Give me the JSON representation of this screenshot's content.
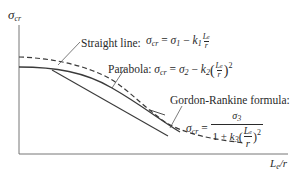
{
  "diagram": {
    "y_axis_label": {
      "symbol": "σ",
      "subscript": "cr"
    },
    "x_axis_label": {
      "numerator": "L",
      "num_sub": "e",
      "slash": "/",
      "denominator": "r"
    },
    "curves": [
      {
        "name": "Straight line",
        "style": "solid"
      },
      {
        "name": "Parabola",
        "style": "solid"
      },
      {
        "name": "Gordon-Rankine formula",
        "style": "dashed"
      }
    ],
    "colors": {
      "line": "#3a3a3a",
      "axis": "#555555",
      "text": "#2a2a2a"
    }
  },
  "labels": {
    "straight": {
      "title": "Straight line:",
      "lhs": "σ",
      "lhs_sub": "cr",
      "eq": " = ",
      "t1": "σ",
      "t1_sub": "1",
      "minus": " − ",
      "k": "k",
      "k_sub": "1",
      "frac_num": "L",
      "frac_num_sub": "e",
      "frac_den": "r"
    },
    "parabola": {
      "title": "Parabola:",
      "lhs": "σ",
      "lhs_sub": "cr",
      "eq": " = ",
      "t1": "σ",
      "t1_sub": "2",
      "minus": " − ",
      "k": "k",
      "k_sub": "2",
      "lparen": "(",
      "frac_num": "L",
      "frac_num_sub": "e",
      "frac_den": "r",
      "rparen": ")",
      "exp": "2"
    },
    "gordon": {
      "title": "Gordon-Rankine formula:",
      "lhs": "σ",
      "lhs_sub": "cr",
      "eq": " = ",
      "num": "σ",
      "num_sub": "3",
      "den_one": "1 + ",
      "k": "k",
      "k_sub": "3",
      "lparen": "(",
      "frac_num": "L",
      "frac_num_sub": "e",
      "frac_den": "r",
      "rparen": ")",
      "exp": "2"
    }
  }
}
